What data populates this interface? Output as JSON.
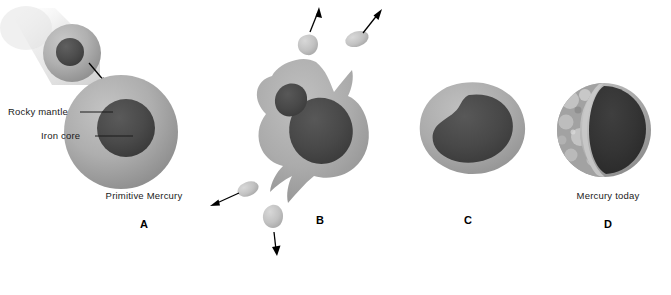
{
  "figure": {
    "background_color": "#ffffff"
  },
  "colors": {
    "mantle": "#a8a8a8",
    "mantle_light": "#bdbdbd",
    "mantle_shadow": "#919191",
    "core": "#4a4a4a",
    "core_dark": "#3c3c3c",
    "ejecta": "#c2c2c2",
    "surface_crater": "#9e9e9e",
    "arrow": "#000000",
    "text": "#1a1a1a",
    "blur_trail": "#d8d8d8"
  },
  "panels": [
    {
      "id": "A",
      "letter": "A",
      "caption": "Primitive Mercury",
      "annotations": [
        {
          "id": "rocky-mantle",
          "label": "Rocky mantle"
        },
        {
          "id": "iron-core",
          "label": "Iron core"
        }
      ],
      "description": "An impactor body with rocky mantle and iron core streaks in from upper left toward the larger primitive Mercury, which has a thick rocky mantle surrounding an iron core."
    },
    {
      "id": "B",
      "letter": "B",
      "caption": "",
      "annotations": [],
      "ejecta_count": 4,
      "description": "The collision splashes the planet into an irregular blob; fragments of rocky mantle material are ejected outward in four directions."
    },
    {
      "id": "C",
      "letter": "C",
      "caption": "",
      "annotations": [],
      "description": "The remaining material re-coalesces into a lumpy body with only a thin rocky mantle left over the large iron core."
    },
    {
      "id": "D",
      "letter": "D",
      "caption": "Mercury today",
      "annotations": [],
      "description": "Cutaway view of present-day Mercury showing a cratered rocky surface and a disproportionately large iron core."
    }
  ]
}
